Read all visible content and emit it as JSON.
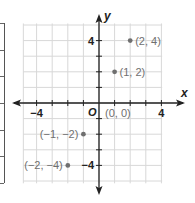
{
  "chart_data": {
    "type": "scatter",
    "title": "",
    "xlabel": "x",
    "ylabel": "y",
    "origin_label": "O",
    "xlim": [
      -5,
      5
    ],
    "ylim": [
      -5,
      5
    ],
    "grid": true,
    "x_ticks_labeled": [
      -4,
      4
    ],
    "y_ticks_labeled": [
      4,
      -4
    ],
    "x_tick_labels": [
      "−4",
      "4"
    ],
    "y_tick_labels": [
      "4",
      "−4"
    ],
    "points": [
      {
        "x": 2,
        "y": 4,
        "label": "(2, 4)"
      },
      {
        "x": 1,
        "y": 2,
        "label": "(1, 2)"
      },
      {
        "x": 0,
        "y": 0,
        "label": "(0, 0)"
      },
      {
        "x": -1,
        "y": -2,
        "label": "(−1, −2)"
      },
      {
        "x": -2,
        "y": -4,
        "label": "(−2, −4)"
      }
    ],
    "colors": {
      "grid": "#d8d8d8",
      "axis": "#222222",
      "point": "#6f6f6f",
      "label": "#6f6f6f"
    }
  },
  "left_table_fragment": {
    "visible": true,
    "row_rules": 7
  }
}
